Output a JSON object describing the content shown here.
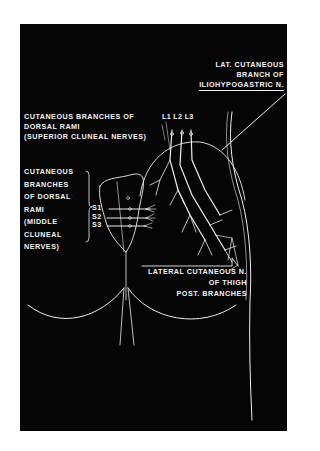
{
  "figure": {
    "background": "#050505",
    "stroke_color": "#eeeeee",
    "labels": {
      "iliohypogastric": {
        "lines": [
          "LAT. CUTANEOUS",
          "BRANCH OF",
          "ILIOHYPOGASTRIC N."
        ]
      },
      "superior_cluneal": {
        "lines": [
          "CUTANEOUS BRANCHES OF",
          "DORSAL RAMI",
          "(SUPERIOR CLUNEAL NERVES)"
        ]
      },
      "middle_cluneal": {
        "lines": [
          "CUTANEOUS",
          "BRANCHES",
          "OF DORSAL",
          "RAMI",
          "(MIDDLE",
          "CLUNEAL",
          "NERVES)"
        ]
      },
      "lumbar_levels": [
        "L1",
        "L2",
        "L3"
      ],
      "sacral_levels": [
        "S1",
        "S2",
        "S3"
      ],
      "lateral_cutaneous_thigh": {
        "lines": [
          "LATERAL CUTANEOUS N.",
          "OF THIGH",
          "POST. BRANCHES"
        ]
      }
    }
  }
}
